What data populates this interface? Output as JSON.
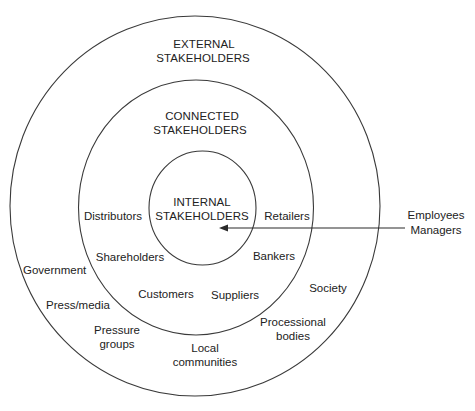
{
  "diagram": {
    "type": "concentric-stakeholder-map",
    "rings": [
      {
        "id": "external",
        "label_lines": [
          "EXTERNAL",
          "STAKEHOLDERS"
        ],
        "cx": 195,
        "cy": 206,
        "rx": 185,
        "ry": 190
      },
      {
        "id": "connected",
        "label_lines": [
          "CONNECTED",
          "STAKEHOLDERS"
        ],
        "cx": 196,
        "cy": 207.5,
        "rx": 117.5,
        "ry": 127.5
      },
      {
        "id": "internal",
        "label_lines": [
          "INTERNAL",
          "STAKEHOLDERS"
        ],
        "cx": 202.5,
        "cy": 208,
        "rx": 53.5,
        "ry": 57
      }
    ],
    "connected_stakeholders": {
      "distributors": "Distributors",
      "retailers": "Retailers",
      "shareholders": "Shareholders",
      "bankers": "Bankers",
      "customers": "Customers",
      "suppliers": "Suppliers"
    },
    "external_stakeholders": {
      "government": "Government",
      "press_media": "Press/media",
      "pressure_groups": [
        "Pressure",
        "groups"
      ],
      "local_communities": [
        "Local",
        "communities"
      ],
      "professional_bodies": [
        "Processional",
        "bodies"
      ],
      "society": "Society"
    },
    "internal_callout": {
      "lines": [
        "Employees",
        "Managers"
      ],
      "arrow": {
        "from_x": 405,
        "to_x": 219,
        "y": 228
      }
    },
    "colors": {
      "stroke": "#3a3a3a",
      "text": "#222222",
      "background": "#ffffff"
    }
  }
}
